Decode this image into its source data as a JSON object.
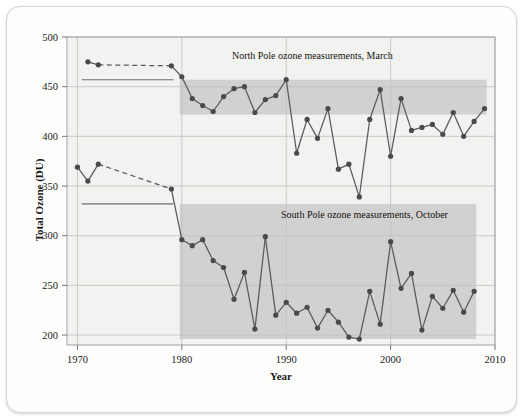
{
  "figure": {
    "background_color": "#fdfdfc",
    "plot_background_color": "#f2f2f0",
    "marker_color": "#4a4a4a",
    "line_color": "#5a5a5a",
    "band_color": "#c9c9c9",
    "grid_color": "#c0c0be"
  },
  "chart_data": {
    "type": "line",
    "title": "",
    "xlabel": "Year",
    "ylabel": "Total Ozone (DU)",
    "xlim": [
      1969,
      2010
    ],
    "ylim": [
      190,
      500
    ],
    "xticks": [
      1970,
      1980,
      1990,
      2000,
      2010
    ],
    "yticks": [
      200,
      250,
      300,
      350,
      400,
      450,
      500
    ],
    "grid": true,
    "legend_position": "inline-annotations",
    "annotations": [
      {
        "text": "North Pole ozone measurements, March",
        "x": 1992.5,
        "y": 478
      },
      {
        "text": "South Pole ozone measurements, October",
        "x": 1997.5,
        "y": 318
      }
    ],
    "reference_bands": [
      {
        "name": "north-pole-pre-depletion-band",
        "series": "North Pole ozone measurements, March",
        "level": 457,
        "line_x_range": [
          1970.4,
          1979.2
        ],
        "band_x_range": [
          1979.8,
          2009.2
        ],
        "band_bottom": 422
      },
      {
        "name": "south-pole-pre-depletion-band",
        "series": "South Pole ozone measurements, October",
        "level": 332,
        "line_x_range": [
          1970.4,
          1979.2
        ],
        "band_x_range": [
          1979.8,
          2008.2
        ],
        "band_bottom": 196
      }
    ],
    "series": [
      {
        "name": "North Pole ozone measurements, March",
        "dashed_segment": {
          "from_x": 1972,
          "to_x": 1979,
          "note": "gap in record shown as dashed connector"
        },
        "x": [
          1971,
          1972,
          1979,
          1980,
          1981,
          1982,
          1983,
          1984,
          1985,
          1986,
          1987,
          1988,
          1989,
          1990,
          1991,
          1992,
          1993,
          1994,
          1995,
          1996,
          1997,
          1998,
          1999,
          2000,
          2001,
          2002,
          2003,
          2004,
          2005,
          2006,
          2007,
          2008,
          2009
        ],
        "y": [
          475,
          472,
          471,
          460,
          438,
          431,
          425,
          440,
          448,
          450,
          424,
          437,
          441,
          457,
          383,
          417,
          398,
          428,
          367,
          372,
          339,
          417,
          447,
          380,
          438,
          406,
          409,
          412,
          402,
          424,
          400,
          415,
          428
        ]
      },
      {
        "name": "South Pole ozone measurements, October",
        "dashed_segment": {
          "from_x": 1972,
          "to_x": 1979,
          "note": "gap in record shown as dashed connector"
        },
        "x": [
          1970,
          1971,
          1972,
          1979,
          1980,
          1981,
          1982,
          1983,
          1984,
          1985,
          1986,
          1987,
          1988,
          1989,
          1990,
          1991,
          1992,
          1993,
          1994,
          1995,
          1996,
          1997,
          1998,
          1999,
          2000,
          2001,
          2002,
          2003,
          2004,
          2005,
          2006,
          2007,
          2008
        ],
        "y": [
          369,
          355,
          372,
          347,
          296,
          290,
          296,
          275,
          268,
          236,
          263,
          206,
          299,
          220,
          233,
          222,
          228,
          207,
          225,
          213,
          198,
          196,
          244,
          211,
          294,
          247,
          262,
          205,
          239,
          227,
          245,
          223,
          244
        ]
      }
    ]
  },
  "axes": {
    "y_title": "Total Ozone (DU)",
    "x_title": "Year",
    "y_tick_labels": [
      "500",
      "450",
      "400",
      "350",
      "300",
      "250",
      "200"
    ],
    "x_tick_labels": [
      "1970",
      "1980",
      "1990",
      "2000",
      "2010"
    ]
  },
  "labels": {
    "north_pole": "North Pole ozone measurements, March",
    "south_pole": "South Pole ozone measurements, October"
  }
}
